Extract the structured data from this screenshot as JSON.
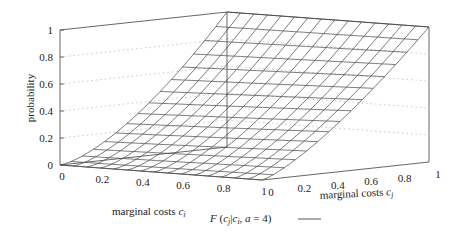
{
  "chart_data": {
    "type": "surface",
    "title": "",
    "legend": [
      {
        "label": "F (c_j | c_i, a = 4)",
        "style": "line"
      }
    ],
    "xlabel": "marginal costs c_i",
    "ylabel": "marginal costs c_j",
    "zlabel": "probability",
    "xlim": [
      0,
      1
    ],
    "ylim": [
      0,
      1
    ],
    "zlim": [
      0,
      1
    ],
    "x_ticks": [
      "0",
      "0.2",
      "0.4",
      "0.6",
      "0.8",
      "1"
    ],
    "y_ticks": [
      "0",
      "0.2",
      "0.4",
      "0.6",
      "0.8",
      "1"
    ],
    "z_ticks": [
      "0",
      "0.2",
      "0.4",
      "0.6",
      "0.8",
      "1"
    ],
    "grid": true,
    "mesh_intervals": 15,
    "surface_description": "F rises from 0 at c_j=0 to 1 at c_j=1 for all c_i; convex in c_j (approx c_j^1.5 at c_i=0, c_j^1.3 at c_i=1)",
    "samples": {
      "c_i": [
        0,
        0.5,
        1
      ],
      "c_j": [
        0,
        0.25,
        0.5,
        0.75,
        1
      ],
      "F": [
        [
          0,
          0.13,
          0.35,
          0.65,
          1
        ],
        [
          0,
          0.15,
          0.38,
          0.68,
          1
        ],
        [
          0,
          0.16,
          0.41,
          0.69,
          1
        ]
      ]
    }
  },
  "labels": {
    "zlabel": "probability",
    "xlabel_text": "marginal costs ",
    "xlabel_sub": "c",
    "xlabel_subsub": "i",
    "ylabel_text": "marginal costs ",
    "ylabel_sub": "c",
    "ylabel_subsub": "j",
    "legend_label": "F (c_j | c_i, a = 4)"
  }
}
